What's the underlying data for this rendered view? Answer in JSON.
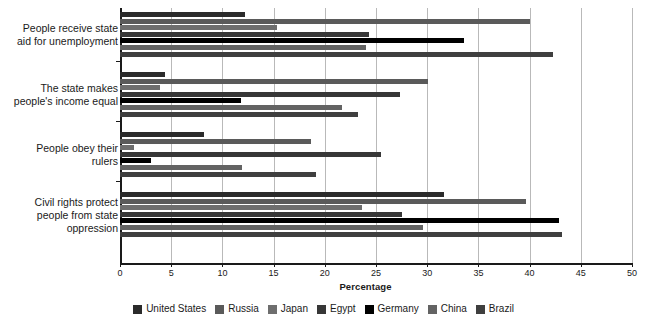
{
  "chart_data": {
    "type": "bar",
    "orientation": "horizontal",
    "title": "",
    "xlabel": "Percentage",
    "ylabel": "",
    "xlim": [
      0,
      50
    ],
    "xticks": [
      0,
      5,
      10,
      15,
      20,
      25,
      30,
      35,
      40,
      45,
      50
    ],
    "grid": true,
    "legend_position": "bottom",
    "categories": [
      "People receive state aid for unemployment",
      "The state makes people's income equal",
      "People obey their rulers",
      "Civil rights protect people from state oppression"
    ],
    "category_lines": [
      [
        "People receive state",
        "aid for unemployment"
      ],
      [
        "The state makes",
        "people's income equal"
      ],
      [
        "People obey their",
        "rulers"
      ],
      [
        "Civil rights protect",
        "people from state",
        "oppression"
      ]
    ],
    "series": [
      {
        "name": "United States",
        "color": "#2b2b2b",
        "values": [
          12.2,
          4.4,
          8.2,
          31.6
        ]
      },
      {
        "name": "Russia",
        "color": "#5a5a5a",
        "values": [
          40.0,
          30.1,
          18.7,
          39.6
        ]
      },
      {
        "name": "Japan",
        "color": "#6e6e6e",
        "values": [
          15.3,
          3.9,
          1.4,
          23.6
        ]
      },
      {
        "name": "Egypt",
        "color": "#373737",
        "values": [
          24.3,
          27.3,
          25.5,
          27.5
        ]
      },
      {
        "name": "Germany",
        "color": "#000000",
        "values": [
          33.6,
          11.8,
          3.0,
          42.9
        ]
      },
      {
        "name": "China",
        "color": "#636363",
        "values": [
          24.0,
          21.7,
          11.9,
          29.6
        ]
      },
      {
        "name": "Brazil",
        "color": "#3f3f3f",
        "values": [
          42.3,
          23.2,
          19.1,
          43.2
        ]
      }
    ]
  },
  "axis": {
    "tick_labels": [
      "0",
      "5",
      "10",
      "15",
      "20",
      "25",
      "30",
      "35",
      "40",
      "45",
      "50"
    ],
    "x_title": "Percentage"
  }
}
